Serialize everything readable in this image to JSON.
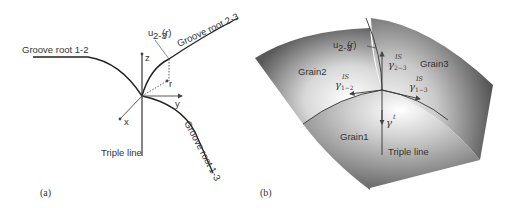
{
  "panel_a": {
    "label": "(a)",
    "groove_root_12": "Groove root 1-2",
    "groove_root_23": "Groove root 2-3",
    "groove_root_13": "Groove root 1-3",
    "triple_line": "Triple line",
    "displacement": "u",
    "displacement_sub": "2-3",
    "displacement_arg": "(r)",
    "axis_x": "x",
    "axis_y": "y",
    "axis_z": "z",
    "vector_r": "r"
  },
  "panel_b": {
    "label": "(b)",
    "grain1": "Grain1",
    "grain2": "Grain2",
    "grain3": "Grain3",
    "triple_line": "Triple line",
    "displacement": "u",
    "displacement_sub": "2-3",
    "displacement_arg": "(r)",
    "gamma_symbol": "γ",
    "gamma_sup_is": "IS",
    "gamma_sup_t": "t",
    "gamma_23_sub": "2−3",
    "gamma_12_sub": "1−2",
    "gamma_13_sub": "1−3"
  }
}
